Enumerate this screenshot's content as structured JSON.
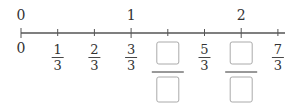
{
  "number_line": {
    "top_labels": [
      {
        "value": 0,
        "text": "0"
      },
      {
        "value": 1,
        "text": "1"
      },
      {
        "value": 2,
        "text": "2"
      }
    ],
    "tick_count_per_unit": 3,
    "range": [
      0,
      2.3333
    ],
    "bottom_labels": [
      {
        "index": 0,
        "type": "whole",
        "text": "0"
      },
      {
        "index": 1,
        "type": "fraction",
        "numerator": "1",
        "denominator": "3"
      },
      {
        "index": 2,
        "type": "fraction",
        "numerator": "2",
        "denominator": "3"
      },
      {
        "index": 3,
        "type": "fraction",
        "numerator": "3",
        "denominator": "3"
      },
      {
        "index": 4,
        "type": "blank",
        "numerator": "",
        "denominator": ""
      },
      {
        "index": 5,
        "type": "fraction",
        "numerator": "5",
        "denominator": "3"
      },
      {
        "index": 6,
        "type": "blank",
        "numerator": "",
        "denominator": ""
      },
      {
        "index": 7,
        "type": "fraction",
        "numerator": "7",
        "denominator": "3"
      }
    ],
    "colors": {
      "line": "#555555",
      "text": "#333333",
      "box": "#aaaaaa"
    }
  }
}
